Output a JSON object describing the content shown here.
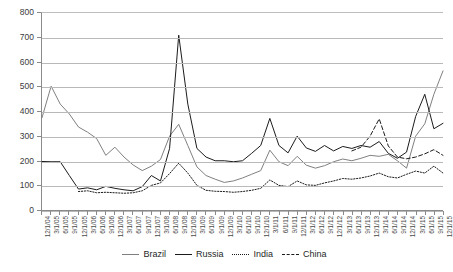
{
  "chart_data": {
    "type": "line",
    "title": "",
    "xlabel": "",
    "ylabel": "",
    "ylim": [
      0,
      800
    ],
    "ytick_step": 100,
    "ytick_labels": [
      "800",
      "700",
      "600",
      "500",
      "400",
      "300",
      "200",
      "100",
      "0"
    ],
    "grid": true,
    "legend_position": "bottom",
    "x": [
      "12/1/04",
      "3/1/05",
      "6/1/05",
      "9/1/05",
      "12/1/05",
      "3/1/06",
      "6/1/06",
      "9/1/06",
      "12/1/06",
      "3/1/07",
      "6/1/07",
      "9/1/07",
      "12/1/07",
      "3/1/08",
      "6/1/08",
      "9/1/08",
      "12/1/08",
      "3/1/09",
      "6/1/09",
      "9/1/09",
      "12/1/09",
      "3/1/10",
      "6/1/10",
      "9/1/10",
      "12/1/10",
      "3/1/11",
      "6/1/11",
      "9/1/11",
      "12/1/11",
      "3/1/12",
      "6/1/12",
      "9/1/12",
      "12/1/12",
      "3/1/13",
      "6/1/13",
      "9/1/13",
      "12/1/13",
      "3/1/14",
      "6/1/14",
      "9/1/14",
      "12/1/14",
      "3/1/15",
      "6/1/15",
      "9/1/15",
      "12/1/15"
    ],
    "series": [
      {
        "name": "Brazil",
        "style": "solid",
        "color": "#7f7f7f",
        "values": [
          375,
          503,
          430,
          390,
          337,
          316,
          290,
          222,
          255,
          215,
          183,
          160,
          178,
          205,
          300,
          348,
          262,
          175,
          140,
          125,
          112,
          118,
          130,
          145,
          160,
          243,
          196,
          180,
          218,
          182,
          170,
          180,
          196,
          207,
          200,
          210,
          222,
          218,
          226,
          200,
          170,
          300,
          350,
          470,
          565
        ]
      },
      {
        "name": "Russia",
        "style": "solid",
        "color": "#1a1a1a",
        "values": [
          197,
          196,
          196,
          140,
          85,
          90,
          82,
          96,
          88,
          82,
          78,
          95,
          140,
          118,
          250,
          710,
          430,
          250,
          215,
          200,
          200,
          196,
          200,
          230,
          262,
          372,
          262,
          232,
          300,
          252,
          238,
          262,
          240,
          258,
          250,
          262,
          255,
          278,
          230,
          210,
          235,
          380,
          470,
          330,
          352
        ]
      },
      {
        "name": "India",
        "style": "dotted",
        "color": "#1a1a1a",
        "values": [
          null,
          null,
          null,
          null,
          75,
          78,
          70,
          72,
          70,
          68,
          70,
          78,
          100,
          110,
          148,
          190,
          150,
          100,
          80,
          76,
          75,
          72,
          75,
          80,
          88,
          122,
          100,
          95,
          118,
          102,
          100,
          110,
          118,
          128,
          125,
          130,
          138,
          150,
          135,
          130,
          145,
          158,
          150,
          178,
          150
        ]
      },
      {
        "name": "China",
        "style": "dashed",
        "color": "#1a1a1a",
        "values": [
          null,
          null,
          null,
          null,
          null,
          null,
          null,
          null,
          null,
          null,
          null,
          null,
          null,
          null,
          null,
          null,
          null,
          null,
          null,
          null,
          null,
          null,
          null,
          null,
          null,
          null,
          null,
          null,
          null,
          null,
          null,
          null,
          null,
          null,
          240,
          255,
          300,
          370,
          260,
          215,
          208,
          215,
          228,
          245,
          222
        ]
      }
    ]
  },
  "legend": {
    "items": [
      {
        "label": "Brazil",
        "style": "solid",
        "color": "#7f7f7f"
      },
      {
        "label": "Russia",
        "style": "solid",
        "color": "#1a1a1a"
      },
      {
        "label": "India",
        "style": "dotted",
        "color": "#1a1a1a"
      },
      {
        "label": "China",
        "style": "dashed",
        "color": "#1a1a1a"
      }
    ]
  }
}
